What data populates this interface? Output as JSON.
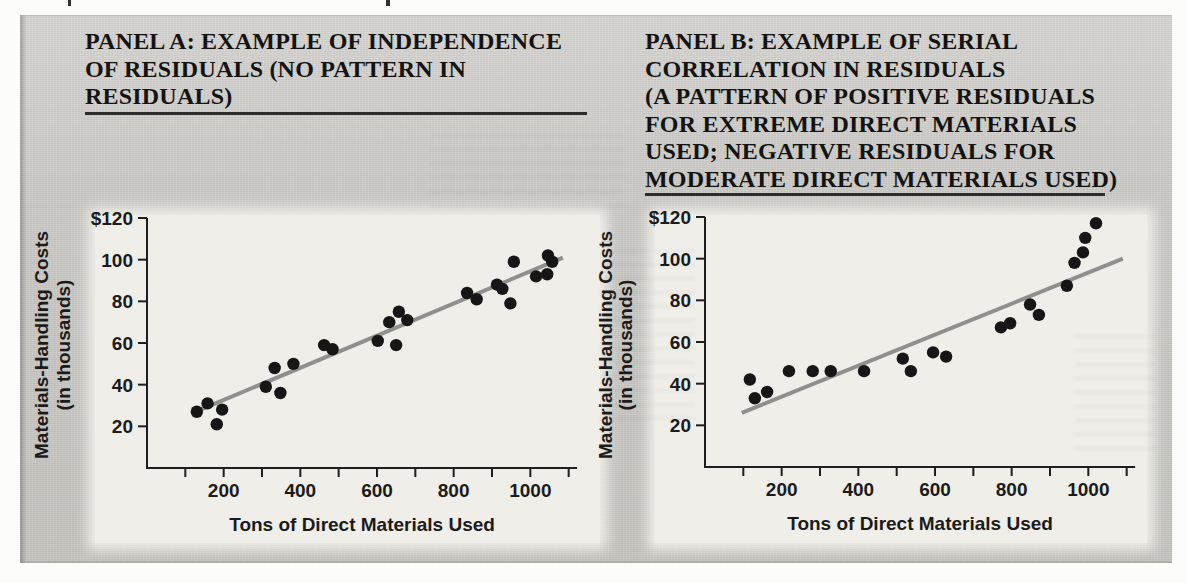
{
  "figure": {
    "panel_a": {
      "title_lines": [
        "PANEL A: EXAMPLE OF INDEPENDENCE",
        "OF RESIDUALS (NO PATTERN IN",
        "RESIDUALS)"
      ]
    },
    "panel_b": {
      "title_lines": [
        "PANEL B: EXAMPLE OF SERIAL",
        "CORRELATION IN RESIDUALS",
        "(A PATTERN OF POSITIVE RESIDUALS",
        "FOR EXTREME DIRECT MATERIALS",
        "USED; NEGATIVE RESIDUALS FOR",
        "MODERATE DIRECT MATERIALS USED)"
      ]
    }
  },
  "chart_data": [
    {
      "id": "panel_a",
      "type": "scatter",
      "title": "PANEL A: EXAMPLE OF INDEPENDENCE OF RESIDUALS (NO PATTERN IN RESIDUALS)",
      "xlabel": "Tons of Direct Materials Used",
      "ylabel_lines": [
        "Materials-Handling Costs",
        "(in thousands)"
      ],
      "xlim": [
        0,
        1122
      ],
      "ylim": [
        0,
        120
      ],
      "x_ticks": [
        100,
        200,
        300,
        400,
        500,
        600,
        700,
        800,
        900,
        1000,
        1100
      ],
      "x_tick_labels": {
        "200": "200",
        "400": "400",
        "600": "600",
        "800": "800",
        "1000": "1000"
      },
      "y_ticks": [
        20,
        40,
        60,
        80,
        100,
        120
      ],
      "y_tick_labels": [
        "20",
        "40",
        "60",
        "80",
        "100",
        "$120"
      ],
      "grid": false,
      "legend": null,
      "points": [
        [
          130,
          27
        ],
        [
          158,
          31
        ],
        [
          182,
          21
        ],
        [
          196,
          28
        ],
        [
          310,
          39
        ],
        [
          333,
          48
        ],
        [
          348,
          36
        ],
        [
          382,
          50
        ],
        [
          462,
          59
        ],
        [
          484,
          57
        ],
        [
          602,
          61
        ],
        [
          632,
          70
        ],
        [
          650,
          59
        ],
        [
          657,
          75
        ],
        [
          679,
          71
        ],
        [
          835,
          84
        ],
        [
          860,
          81
        ],
        [
          913,
          88
        ],
        [
          927,
          86
        ],
        [
          948,
          79
        ],
        [
          957,
          99
        ],
        [
          1015,
          92
        ],
        [
          1044,
          93
        ],
        [
          1046,
          102
        ],
        [
          1057,
          99
        ]
      ],
      "regression_line": {
        "x1": 140,
        "y1": 28,
        "x2": 1085,
        "y2": 101
      },
      "point_color": "#161616",
      "line_color": "#8f8f8d",
      "axis_color": "#1e1e1e"
    },
    {
      "id": "panel_b",
      "type": "scatter",
      "title": "PANEL B: EXAMPLE OF SERIAL CORRELATION IN RESIDUALS (A PATTERN OF POSITIVE RESIDUALS FOR EXTREME DIRECT MATERIALS USED; NEGATIVE RESIDUALS FOR MODERATE DIRECT MATERIALS USED)",
      "xlabel": "Tons of Direct Materials Used",
      "ylabel_lines": [
        "Materials-Handling Costs",
        "(in thousands)"
      ],
      "xlim": [
        0,
        1122
      ],
      "ylim": [
        0,
        120
      ],
      "x_ticks": [
        100,
        200,
        300,
        400,
        500,
        600,
        700,
        800,
        900,
        1000,
        1100
      ],
      "x_tick_labels": {
        "200": "200",
        "400": "400",
        "600": "600",
        "800": "800",
        "1000": "1000"
      },
      "y_ticks": [
        20,
        40,
        60,
        80,
        100,
        120
      ],
      "y_tick_labels": [
        "20",
        "40",
        "60",
        "80",
        "100",
        "$120"
      ],
      "grid": false,
      "legend": null,
      "points": [
        [
          117,
          42
        ],
        [
          130,
          33
        ],
        [
          162,
          36
        ],
        [
          219,
          46
        ],
        [
          281,
          46
        ],
        [
          328,
          46
        ],
        [
          415,
          46
        ],
        [
          516,
          52
        ],
        [
          537,
          46
        ],
        [
          595,
          55
        ],
        [
          629,
          53
        ],
        [
          772,
          67
        ],
        [
          796,
          69
        ],
        [
          848,
          78
        ],
        [
          871,
          73
        ],
        [
          944,
          87
        ],
        [
          964,
          98
        ],
        [
          986,
          103
        ],
        [
          992,
          110
        ],
        [
          1020,
          117
        ]
      ],
      "regression_line": {
        "x1": 96,
        "y1": 26,
        "x2": 1090,
        "y2": 100
      },
      "point_color": "#161616",
      "line_color": "#8f8f8d",
      "axis_color": "#1e1e1e"
    }
  ]
}
